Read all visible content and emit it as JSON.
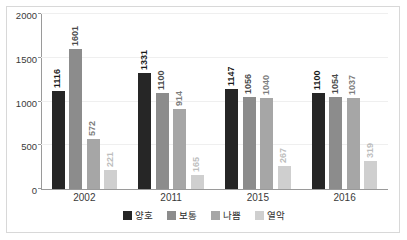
{
  "chart_data": {
    "type": "bar",
    "title": "",
    "subtitle": "",
    "xlabel": "",
    "ylabel": "",
    "categories": [
      "2002",
      "2011",
      "2015",
      "2016"
    ],
    "series": [
      {
        "name": "양호",
        "color": "#262626",
        "label_color": "#1a1a1a",
        "values": [
          1116,
          1331,
          1147,
          1100
        ]
      },
      {
        "name": "보통",
        "color": "#8c8c8c",
        "label_color": "#4a4a4a",
        "values": [
          1601,
          1100,
          1056,
          1054
        ]
      },
      {
        "name": "나쁨",
        "color": "#a6a6a6",
        "label_color": "#7d7d7d",
        "values": [
          572,
          914,
          1040,
          1037
        ]
      },
      {
        "name": "열악",
        "color": "#cfcfcf",
        "label_color": "#bdbdbd",
        "values": [
          221,
          165,
          267,
          319
        ]
      }
    ],
    "ylim": [
      0,
      2000
    ],
    "ytick_labels": [
      "0",
      "500",
      "1000",
      "1500",
      "2000"
    ],
    "ytick_values": [
      0,
      500,
      1000,
      1500,
      2000
    ],
    "grid": true,
    "legend_position": "bottom",
    "data_labels": true,
    "data_label_rotation": -90
  },
  "frame": {
    "border_color": "#d8d8d8",
    "background": "#ffffff"
  },
  "axis": {
    "line_color": "#9a9a9a",
    "gridline_color": "#efefef",
    "tick_text_color": "#3a3a3a"
  }
}
